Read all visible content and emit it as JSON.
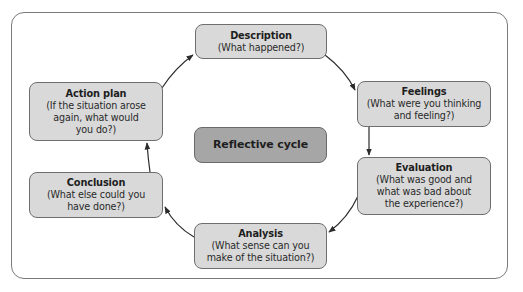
{
  "diagram": {
    "type": "cycle",
    "center": {
      "label": "Reflective cycle"
    },
    "stages": [
      {
        "id": "description",
        "title": "Description",
        "desc": "(What happened?)"
      },
      {
        "id": "feelings",
        "title": "Feelings",
        "desc": "(What were you thinking\nand feeling?)"
      },
      {
        "id": "evaluation",
        "title": "Evaluation",
        "desc": "(What was good and\nwhat was bad about\nthe experience?)"
      },
      {
        "id": "analysis",
        "title": "Analysis",
        "desc": "(What sense can you\nmake of the situation?)"
      },
      {
        "id": "conclusion",
        "title": "Conclusion",
        "desc": "(What else could you\nhave done?)"
      },
      {
        "id": "action-plan",
        "title": "Action plan",
        "desc": "(If the situation arose\nagain, what would\nyou do?)"
      }
    ],
    "edges": [
      {
        "from": "description",
        "to": "feelings"
      },
      {
        "from": "feelings",
        "to": "evaluation"
      },
      {
        "from": "evaluation",
        "to": "analysis"
      },
      {
        "from": "analysis",
        "to": "conclusion"
      },
      {
        "from": "conclusion",
        "to": "action-plan"
      },
      {
        "from": "action-plan",
        "to": "description"
      }
    ],
    "colors": {
      "stage_fill": "#d9d9d9",
      "center_fill": "#a6a6a6",
      "border": "#6e6e6e",
      "arrow": "#2b2b2b"
    }
  }
}
